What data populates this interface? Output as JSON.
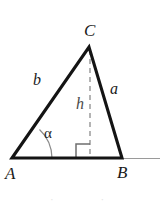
{
  "figure": {
    "kind": "geometry-diagram",
    "background_color": "#ffffff",
    "stroke_color": "#141414",
    "dashed_color": "#8c8c8c",
    "ray_color": "#9a9a9a",
    "text_color": "#1a1a1a"
  },
  "vertices": {
    "C": {
      "label": "C",
      "x": 89,
      "y": 47
    },
    "A": {
      "label": "A",
      "x": 12,
      "y": 158
    },
    "B": {
      "label": "B",
      "x": 122,
      "y": 158
    }
  },
  "sides": {
    "b": {
      "label": "b",
      "from": "A",
      "to": "C"
    },
    "a": {
      "label": "a",
      "from": "C",
      "to": "B"
    },
    "c": {
      "label": "",
      "from": "A",
      "to": "B"
    }
  },
  "altitude": {
    "label": "h",
    "from": "C",
    "foot_x": 90,
    "foot_y": 158,
    "style": "dashed",
    "right_angle_marker": true
  },
  "angle": {
    "label": "α",
    "at_vertex": "A",
    "marker": "arc"
  },
  "base_ray": {
    "label": "",
    "from_x": 122,
    "to_x": 160,
    "y": 158
  },
  "artifacts": {
    "bottom_fragment": "· ·"
  }
}
